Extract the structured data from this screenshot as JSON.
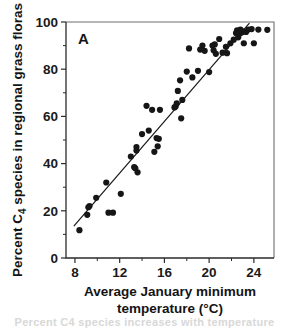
{
  "figure": {
    "panel_label": "A",
    "partial_caption": "Percent C4 species increases with temperature"
  },
  "chart_data": {
    "type": "scatter",
    "title": "",
    "panel": "A",
    "xlabel_line1": "Average January minimum",
    "xlabel_line2": "temperature (°C)",
    "ylabel_prefix": "Percent C",
    "ylabel_subscript": "4",
    "ylabel_suffix": " species in regional grass floras",
    "xlim": [
      7.2,
      25.8
    ],
    "ylim": [
      0,
      100
    ],
    "xticks": [
      8,
      12,
      16,
      20,
      24
    ],
    "xticklabels": [
      "8",
      "12",
      "16",
      "20",
      "24"
    ],
    "xticks_minor": [
      10,
      14,
      18,
      22
    ],
    "yticks": [
      0,
      20,
      40,
      60,
      80,
      100
    ],
    "yticklabels": [
      "0",
      "20",
      "40",
      "60",
      "80",
      "100"
    ],
    "yticks_minor": [
      10,
      30,
      50,
      70,
      90
    ],
    "grid": false,
    "legend": false,
    "marker": "filled-circle",
    "marker_color": "#161616",
    "fit_line": {
      "label": "linear regression",
      "x_start": 7.9,
      "y_start": 13.5,
      "x_end": 23.6,
      "y_end": 99.5
    },
    "x": [
      8.4,
      9.1,
      9.2,
      9.3,
      9.9,
      10.8,
      11.0,
      11.4,
      12.1,
      13.0,
      13.3,
      13.4,
      13.5,
      13.5,
      13.6,
      14.0,
      14.4,
      14.6,
      14.9,
      15.1,
      15.3,
      15.4,
      15.5,
      15.6,
      16.9,
      17.0,
      17.1,
      17.2,
      17.4,
      17.5,
      17.6,
      18.0,
      18.2,
      18.5,
      19.0,
      19.2,
      19.4,
      19.6,
      20.0,
      20.3,
      20.4,
      20.5,
      20.6,
      20.9,
      21.2,
      21.5,
      21.6,
      21.9,
      22.2,
      22.4,
      22.5,
      22.6,
      22.7,
      22.8,
      22.9,
      23.0,
      23.1,
      23.3,
      23.5,
      23.8,
      24.0,
      24.4,
      25.2
    ],
    "y": [
      11.8,
      18.3,
      21.5,
      22.0,
      25.5,
      32.0,
      19.2,
      19.2,
      27.2,
      43.0,
      38.5,
      38.0,
      45.5,
      47.0,
      36.3,
      52.5,
      64.5,
      54.0,
      62.8,
      45.0,
      50.8,
      47.3,
      50.5,
      62.8,
      63.8,
      64.2,
      65.5,
      70.8,
      75.3,
      59.2,
      67.0,
      79.0,
      88.8,
      76.5,
      79.3,
      88.3,
      90.0,
      87.8,
      78.8,
      90.0,
      88.0,
      90.5,
      86.5,
      92.8,
      87.0,
      89.5,
      86.8,
      91.0,
      92.5,
      95.3,
      96.5,
      93.5,
      95.0,
      96.8,
      95.5,
      96.0,
      91.0,
      95.8,
      96.8,
      97.0,
      91.0,
      96.8,
      96.7
    ]
  }
}
